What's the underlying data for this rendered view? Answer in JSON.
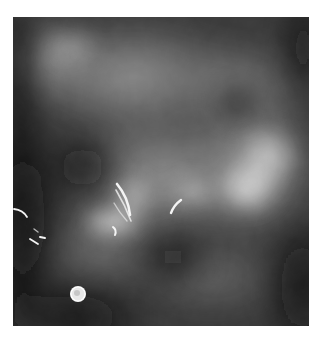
{
  "image": {
    "kind": "mammogram",
    "description": "Grayscale X-ray of breast tissue with bright linear calcifications near center and a round radiopaque marker lower-left",
    "colors": {
      "background": "#ffffff",
      "tissue_dark": "#141414",
      "tissue_mid": "#6a6a6a",
      "tissue_bright": "#d8d8d8",
      "calcification": "#f2f2f2"
    }
  }
}
